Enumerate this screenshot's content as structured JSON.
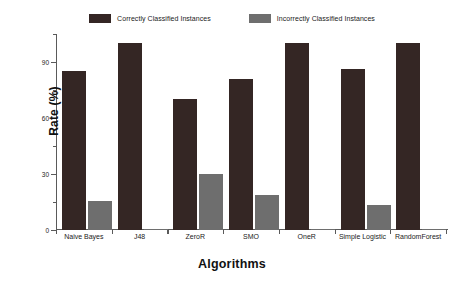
{
  "chart_data": {
    "type": "bar",
    "title": "",
    "xlabel": "Algorithms",
    "ylabel": "Rate (%)",
    "categories": [
      "Naive Bayes",
      "J48",
      "ZeroR",
      "SMO",
      "OneR",
      "Simple Logistic",
      "RandomForest"
    ],
    "series": [
      {
        "name": "Correctly Classified Instances",
        "color": "#342624",
        "values": [
          85,
          100,
          70,
          81,
          100,
          86,
          100
        ]
      },
      {
        "name": "Incorrectly Classified Instances",
        "color": "#6e6e6e",
        "values": [
          15.5,
          0.8,
          30,
          19,
          0.8,
          13.5,
          0.8
        ]
      }
    ],
    "ylim": [
      0,
      105
    ],
    "yticks": [
      0,
      30,
      60,
      90
    ],
    "ytick_labels": [
      "0",
      "30",
      "60",
      "90"
    ],
    "yminor_ticks": [
      15,
      45,
      75,
      105
    ],
    "grid": false,
    "legend_position": "top-center"
  },
  "axes": {
    "x_title": "Algorithms",
    "y_title": "Rate (%)"
  },
  "legend": {
    "entries": [
      {
        "label": "Correctly Classified Instances",
        "color": "#342624"
      },
      {
        "label": "Incorrectly Classified Instances",
        "color": "#6e6e6e"
      }
    ]
  }
}
